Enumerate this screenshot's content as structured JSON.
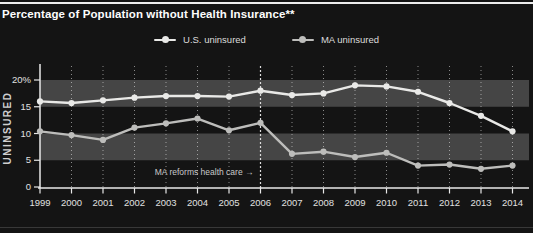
{
  "header": {
    "title": "Percentage of Population without Health Insurance**"
  },
  "legend": [
    {
      "label": "U.S. uninsured",
      "color": "#e9e9e7"
    },
    {
      "label": "MA uninsured",
      "color": "#bdbdbb"
    }
  ],
  "chart_data": {
    "type": "line",
    "title": "Percentage of Population without Health Insurance**",
    "xlabel": "",
    "ylabel": "UNINSURED",
    "x": [
      1999,
      2000,
      2001,
      2002,
      2003,
      2004,
      2005,
      2006,
      2007,
      2008,
      2009,
      2010,
      2011,
      2012,
      2013,
      2014
    ],
    "series": [
      {
        "id": "us",
        "name": "U.S. uninsured",
        "color": "#e9e9e7",
        "values": [
          16.0,
          15.7,
          16.2,
          16.7,
          17.0,
          17.0,
          16.9,
          18.0,
          17.2,
          17.5,
          19.0,
          18.8,
          17.8,
          15.7,
          13.3,
          10.4
        ]
      },
      {
        "id": "ma",
        "name": "MA uninsured",
        "color": "#bdbdbb",
        "values": [
          10.4,
          9.7,
          8.8,
          11.1,
          11.9,
          12.8,
          10.6,
          12.0,
          6.2,
          6.6,
          5.6,
          6.4,
          4.0,
          4.2,
          3.4,
          4.0
        ]
      }
    ],
    "ylim": [
      0,
      21.5
    ],
    "y_ticks": [
      {
        "v": 0,
        "label": "0"
      },
      {
        "v": 5,
        "label": "5"
      },
      {
        "v": 10,
        "label": "10"
      },
      {
        "v": 15,
        "label": "15"
      },
      {
        "v": 20,
        "label": "20%"
      }
    ],
    "bands": [
      [
        15,
        20
      ],
      [
        5,
        10
      ]
    ],
    "grid": "vertical-dotted",
    "legend_position": "top-center",
    "annotation": {
      "text": "MA reforms health care →",
      "year": 2006
    },
    "colors": {
      "background": "#141414",
      "band": "#454545",
      "axis": "#e8e8e8",
      "grid": "rgba(255,255,255,0.5)",
      "reform_line": "#dcdcdc",
      "top_rule": "#ededed"
    }
  }
}
